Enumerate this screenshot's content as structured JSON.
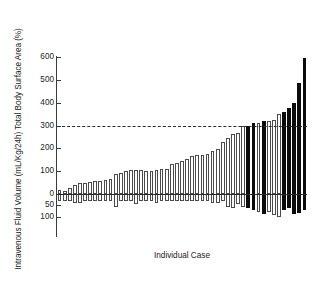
{
  "chart_data": {
    "type": "bar",
    "title": "",
    "subtitle": "",
    "xlabel": "Individual Case",
    "ylabel": "Intravenous Fluid Volume (mL/Kg/24h) Total Body Surface Area (%)",
    "ylim": [
      -100,
      600
    ],
    "yticks": [
      600,
      500,
      400,
      300,
      200,
      100,
      0,
      -50,
      -100
    ],
    "ytick_labels": [
      "600",
      "500",
      "400",
      "300",
      "200",
      "100",
      "0",
      "50",
      "100"
    ],
    "grid": false,
    "legend": null,
    "annotations": [
      {
        "name": "threshold-line",
        "type": "hline",
        "value": 300,
        "style": "dashed",
        "color": "#2a2a2a"
      },
      {
        "name": "zero-baseline",
        "type": "hline",
        "value": 0,
        "style": "solid",
        "color": "#2a2a2a"
      }
    ],
    "colors": {
      "bar_white_fill": "#ffffff",
      "bar_white_edge": "#4a4a4a",
      "bar_black_fill": "#0b0b0b",
      "axis": "#3a3a3a",
      "text": "#222222"
    },
    "series": [
      {
        "name": "Intravenous Fluid Volume (mL/Kg/24h)",
        "direction": "positive",
        "values": [
          18,
          12,
          28,
          40,
          47,
          49,
          52,
          55,
          58,
          62,
          66,
          86,
          92,
          100,
          104,
          105,
          103,
          102,
          101,
          106,
          108,
          108,
          130,
          135,
          146,
          154,
          168,
          169,
          171,
          174,
          188,
          196,
          228,
          244,
          262,
          268,
          296,
          300,
          310,
          312,
          318,
          320,
          322,
          352,
          360,
          378,
          400,
          488,
          594
        ]
      },
      {
        "name": "Total Body Surface Area (%)",
        "direction": "negative",
        "values": [
          -30,
          -30,
          -30,
          -40,
          -40,
          -30,
          -30,
          -30,
          -30,
          -30,
          -30,
          -55,
          -30,
          -30,
          -30,
          -45,
          -30,
          -30,
          -30,
          -40,
          -30,
          -30,
          -30,
          -30,
          -30,
          -30,
          -30,
          -30,
          -30,
          -30,
          -38,
          -40,
          -30,
          -55,
          -60,
          -42,
          -58,
          -62,
          -72,
          -80,
          -88,
          -78,
          -92,
          -100,
          -70,
          -62,
          -88,
          -82,
          -72
        ]
      }
    ],
    "bar_categories": [
      {
        "index": 1,
        "pos": 18,
        "neg": -30,
        "highlight": false
      },
      {
        "index": 2,
        "pos": 12,
        "neg": -30,
        "highlight": false
      },
      {
        "index": 3,
        "pos": 28,
        "neg": -30,
        "highlight": false
      },
      {
        "index": 4,
        "pos": 40,
        "neg": -40,
        "highlight": false
      },
      {
        "index": 5,
        "pos": 47,
        "neg": -40,
        "highlight": false
      },
      {
        "index": 6,
        "pos": 49,
        "neg": -30,
        "highlight": false
      },
      {
        "index": 7,
        "pos": 52,
        "neg": -30,
        "highlight": false
      },
      {
        "index": 8,
        "pos": 55,
        "neg": -30,
        "highlight": false
      },
      {
        "index": 9,
        "pos": 58,
        "neg": -30,
        "highlight": false
      },
      {
        "index": 10,
        "pos": 62,
        "neg": -30,
        "highlight": false
      },
      {
        "index": 11,
        "pos": 66,
        "neg": -30,
        "highlight": false
      },
      {
        "index": 12,
        "pos": 86,
        "neg": -55,
        "highlight": false
      },
      {
        "index": 13,
        "pos": 92,
        "neg": -30,
        "highlight": false
      },
      {
        "index": 14,
        "pos": 100,
        "neg": -30,
        "highlight": false
      },
      {
        "index": 15,
        "pos": 104,
        "neg": -30,
        "highlight": false
      },
      {
        "index": 16,
        "pos": 105,
        "neg": -45,
        "highlight": false
      },
      {
        "index": 17,
        "pos": 103,
        "neg": -30,
        "highlight": false
      },
      {
        "index": 18,
        "pos": 102,
        "neg": -30,
        "highlight": false
      },
      {
        "index": 19,
        "pos": 101,
        "neg": -30,
        "highlight": false
      },
      {
        "index": 20,
        "pos": 106,
        "neg": -40,
        "highlight": false
      },
      {
        "index": 21,
        "pos": 108,
        "neg": -30,
        "highlight": false
      },
      {
        "index": 22,
        "pos": 108,
        "neg": -30,
        "highlight": false
      },
      {
        "index": 23,
        "pos": 130,
        "neg": -30,
        "highlight": false
      },
      {
        "index": 24,
        "pos": 135,
        "neg": -30,
        "highlight": false
      },
      {
        "index": 25,
        "pos": 146,
        "neg": -30,
        "highlight": false
      },
      {
        "index": 26,
        "pos": 154,
        "neg": -30,
        "highlight": false
      },
      {
        "index": 27,
        "pos": 168,
        "neg": -30,
        "highlight": false
      },
      {
        "index": 28,
        "pos": 169,
        "neg": -30,
        "highlight": false
      },
      {
        "index": 29,
        "pos": 171,
        "neg": -30,
        "highlight": false
      },
      {
        "index": 30,
        "pos": 174,
        "neg": -30,
        "highlight": false
      },
      {
        "index": 31,
        "pos": 188,
        "neg": -38,
        "highlight": false
      },
      {
        "index": 32,
        "pos": 196,
        "neg": -40,
        "highlight": false
      },
      {
        "index": 33,
        "pos": 228,
        "neg": -30,
        "highlight": false
      },
      {
        "index": 34,
        "pos": 244,
        "neg": -55,
        "highlight": false
      },
      {
        "index": 35,
        "pos": 262,
        "neg": -60,
        "highlight": false
      },
      {
        "index": 36,
        "pos": 268,
        "neg": -42,
        "highlight": false
      },
      {
        "index": 37,
        "pos": 296,
        "neg": -58,
        "highlight": false
      },
      {
        "index": 38,
        "pos": 300,
        "neg": -62,
        "highlight": true
      },
      {
        "index": 39,
        "pos": 310,
        "neg": -72,
        "highlight": true
      },
      {
        "index": 40,
        "pos": 312,
        "neg": -80,
        "highlight": false
      },
      {
        "index": 41,
        "pos": 318,
        "neg": -88,
        "highlight": true
      },
      {
        "index": 42,
        "pos": 320,
        "neg": -78,
        "highlight": false
      },
      {
        "index": 43,
        "pos": 322,
        "neg": -92,
        "highlight": false
      },
      {
        "index": 44,
        "pos": 352,
        "neg": -100,
        "highlight": false
      },
      {
        "index": 45,
        "pos": 360,
        "neg": -70,
        "highlight": true
      },
      {
        "index": 46,
        "pos": 378,
        "neg": -62,
        "highlight": true
      },
      {
        "index": 47,
        "pos": 400,
        "neg": -88,
        "highlight": true
      },
      {
        "index": 48,
        "pos": 488,
        "neg": -82,
        "highlight": true
      },
      {
        "index": 49,
        "pos": 594,
        "neg": -72,
        "highlight": true
      }
    ]
  }
}
